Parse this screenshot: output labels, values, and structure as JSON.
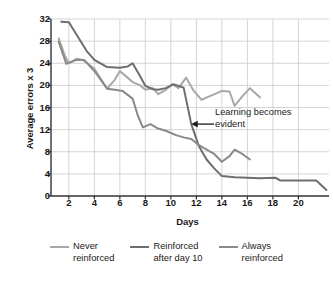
{
  "chart_data": {
    "type": "line",
    "title": "",
    "xlabel": "Days",
    "ylabel": "Average errors x 3",
    "xlim": [
      0.6,
      22.4
    ],
    "ylim": [
      0,
      32
    ],
    "xticks": [
      2,
      4,
      6,
      8,
      10,
      12,
      14,
      16,
      18,
      20
    ],
    "yticks": [
      0,
      4,
      8,
      12,
      16,
      20,
      24,
      28,
      32
    ],
    "grid": true,
    "legend_position": "bottom",
    "annotations": [
      {
        "text": "Learning becomes evident",
        "text_line1": "Learning becomes",
        "text_line2": "evident",
        "arrow": "left-arrow",
        "points_to_x": 11.6,
        "points_to_y": 13.0
      }
    ],
    "series": [
      {
        "name": "Never reinforced",
        "color": "#a8a8a8",
        "points": [
          [
            1.2,
            28.5
          ],
          [
            1.7,
            25.3
          ],
          [
            2.0,
            24.0
          ],
          [
            2.6,
            24.8
          ],
          [
            3.1,
            24.6
          ],
          [
            4.0,
            23.0
          ],
          [
            5.0,
            19.4
          ],
          [
            5.6,
            21.0
          ],
          [
            6.0,
            22.6
          ],
          [
            6.6,
            21.4
          ],
          [
            7.0,
            20.6
          ],
          [
            7.6,
            20.0
          ],
          [
            8.0,
            19.2
          ],
          [
            8.6,
            19.5
          ],
          [
            9.0,
            18.4
          ],
          [
            9.6,
            19.2
          ],
          [
            10.1,
            20.2
          ],
          [
            10.6,
            19.5
          ],
          [
            11.2,
            21.4
          ],
          [
            11.8,
            19.0
          ],
          [
            12.4,
            17.4
          ],
          [
            13.2,
            18.2
          ],
          [
            14.0,
            19.0
          ],
          [
            14.6,
            18.9
          ],
          [
            15.0,
            16.3
          ],
          [
            15.6,
            18.0
          ],
          [
            16.2,
            19.5
          ],
          [
            17.0,
            17.8
          ]
        ]
      },
      {
        "name": "Reinforced after day 10",
        "color": "#6e6e6e",
        "points": [
          [
            1.4,
            31.5
          ],
          [
            2.0,
            31.4
          ],
          [
            3.4,
            26.2
          ],
          [
            4.0,
            24.6
          ],
          [
            5.0,
            23.3
          ],
          [
            6.0,
            23.2
          ],
          [
            6.6,
            23.4
          ],
          [
            7.0,
            24.0
          ],
          [
            7.6,
            21.6
          ],
          [
            8.0,
            19.9
          ],
          [
            8.6,
            19.3
          ],
          [
            9.0,
            19.2
          ],
          [
            9.6,
            19.5
          ],
          [
            10.2,
            20.2
          ],
          [
            11.0,
            19.6
          ],
          [
            11.6,
            13.0
          ],
          [
            12.2,
            9.0
          ],
          [
            12.8,
            6.6
          ],
          [
            13.4,
            5.0
          ],
          [
            14.0,
            3.6
          ],
          [
            15.0,
            3.4
          ],
          [
            16.0,
            3.3
          ],
          [
            17.0,
            3.2
          ],
          [
            18.2,
            3.3
          ],
          [
            18.6,
            2.8
          ],
          [
            19.6,
            2.8
          ],
          [
            20.6,
            2.8
          ],
          [
            21.4,
            2.8
          ],
          [
            22.2,
            1.1
          ]
        ]
      },
      {
        "name": "Always reinforced",
        "color": "#8a8a8a",
        "points": [
          [
            1.2,
            27.9
          ],
          [
            1.8,
            23.9
          ],
          [
            2.6,
            24.6
          ],
          [
            3.2,
            24.6
          ],
          [
            4.0,
            22.6
          ],
          [
            5.0,
            19.4
          ],
          [
            5.6,
            19.2
          ],
          [
            6.2,
            19.0
          ],
          [
            7.0,
            17.6
          ],
          [
            7.4,
            14.6
          ],
          [
            7.8,
            12.4
          ],
          [
            8.4,
            13.0
          ],
          [
            9.0,
            12.2
          ],
          [
            9.6,
            11.8
          ],
          [
            10.4,
            11.0
          ],
          [
            11.0,
            10.6
          ],
          [
            11.6,
            10.3
          ],
          [
            12.2,
            9.2
          ],
          [
            12.8,
            8.4
          ],
          [
            13.4,
            7.6
          ],
          [
            14.0,
            6.2
          ],
          [
            14.6,
            7.2
          ],
          [
            15.0,
            8.4
          ],
          [
            15.6,
            7.6
          ],
          [
            16.2,
            6.6
          ]
        ]
      }
    ]
  },
  "legend": {
    "items": [
      {
        "label": "Never\nreinforced",
        "color": "#a8a8a8"
      },
      {
        "label": "Reinforced\nafter day 10",
        "color": "#6e6e6e"
      },
      {
        "label": "Always\nreinforced",
        "color": "#8a8a8a"
      }
    ]
  },
  "axes": {
    "y_title": "Average errors x 3",
    "x_title": "Days"
  },
  "colors": {
    "grid": "#c9c9c9",
    "axis": "#333333",
    "text": "#1a1a1a"
  }
}
